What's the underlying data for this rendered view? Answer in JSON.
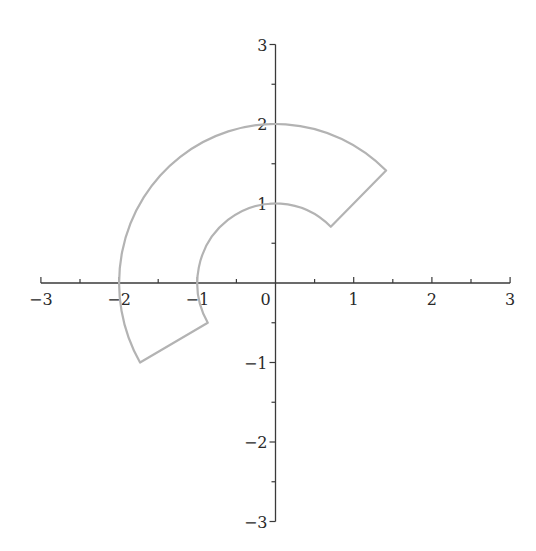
{
  "chart_data": {
    "type": "line",
    "title": "",
    "xlabel": "",
    "ylabel": "",
    "xlim": [
      -3,
      3
    ],
    "ylim": [
      -3,
      3
    ],
    "grid": false,
    "legend": null,
    "x_ticks": [
      -3,
      -2,
      -1,
      0,
      1,
      2,
      3
    ],
    "y_ticks": [
      -3,
      -2,
      -1,
      1,
      2,
      3
    ],
    "x_tick_labels": [
      "−3",
      "−2",
      "−1",
      "0",
      "1",
      "2",
      "3"
    ],
    "y_tick_labels": [
      "−3",
      "−2",
      "−1",
      "1",
      "2",
      "3"
    ],
    "minor_tick_step": 0.5,
    "series": [
      {
        "name": "annular sector boundary",
        "shape": "annular-sector",
        "inner_radius": 1,
        "outer_radius": 2,
        "theta_start_deg": 45,
        "theta_end_deg": 210,
        "corners": [
          {
            "x": 1.414,
            "y": 1.414
          },
          {
            "x": 0.707,
            "y": 0.707
          },
          {
            "x": -0.866,
            "y": -0.5
          },
          {
            "x": -1.732,
            "y": -1.0
          }
        ],
        "color": "#b3b3b3"
      }
    ]
  },
  "colors": {
    "axis": "#3a3a3a",
    "curve": "#b3b3b3",
    "background": "#ffffff"
  }
}
